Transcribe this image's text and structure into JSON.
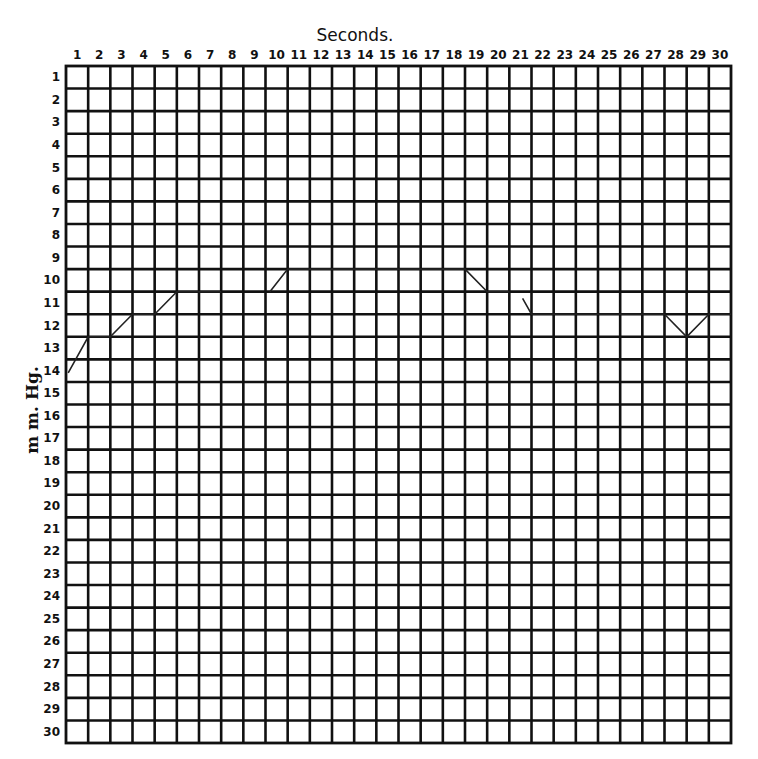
{
  "chart_data": {
    "type": "line",
    "title": "Seconds.",
    "xlabel": "Seconds.",
    "ylabel": "m m. Hg.",
    "x_ticks": [
      "1",
      "2",
      "3",
      "4",
      "5",
      "6",
      "7",
      "8",
      "9",
      "10",
      "11",
      "12",
      "13",
      "14",
      "15",
      "16",
      "17",
      "18",
      "19",
      "20",
      "21",
      "22",
      "23",
      "24",
      "25",
      "26",
      "27",
      "28",
      "29",
      "30"
    ],
    "y_ticks": [
      "1",
      "2",
      "3",
      "4",
      "5",
      "6",
      "7",
      "8",
      "9",
      "10",
      "11",
      "12",
      "13",
      "14",
      "15",
      "16",
      "17",
      "18",
      "19",
      "20",
      "21",
      "22",
      "23",
      "24",
      "25",
      "26",
      "27",
      "28",
      "29",
      "30"
    ],
    "xlim": [
      0,
      30
    ],
    "ylim": [
      0,
      30
    ],
    "y_inverted": true,
    "grid": true,
    "legend": "none",
    "series": [
      {
        "name": "pressure trace segment 1",
        "x": [
          0.1,
          1.0,
          2.0,
          3.0,
          4.0,
          5.0,
          7.0
        ],
        "y": [
          13.6,
          12.0,
          12.0,
          11.0,
          11.0,
          10.0,
          10.0
        ]
      },
      {
        "name": "pressure trace segment 2",
        "x": [
          9.2,
          10.0,
          18.0,
          19.0,
          20.0
        ],
        "y": [
          10.0,
          9.0,
          9.0,
          10.0,
          10.0
        ]
      },
      {
        "name": "pressure trace segment 3",
        "x": [
          20.6,
          21.0,
          27.0,
          28.0,
          29.0,
          30.0
        ],
        "y": [
          10.3,
          11.0,
          11.0,
          12.0,
          11.0,
          11.0
        ]
      }
    ]
  },
  "chart": {
    "title": "Seconds.",
    "y_axis_label": "m m. Hg.",
    "colors": {
      "ink": "#111111",
      "background": "#ffffff"
    }
  }
}
